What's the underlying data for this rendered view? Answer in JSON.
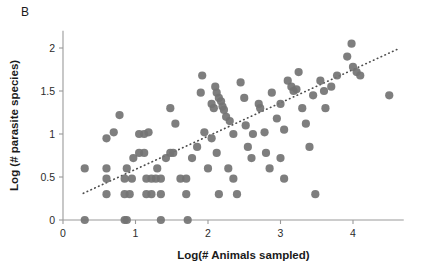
{
  "panel": {
    "label": "B"
  },
  "chart_data": {
    "type": "scatter",
    "title": "",
    "xlabel": "Log(# Animals sampled)",
    "ylabel": "Log (# parasite species)",
    "xlim": [
      0,
      4.7
    ],
    "ylim": [
      0,
      2.2
    ],
    "xticks": [
      0,
      1,
      2,
      3,
      4
    ],
    "yticks": [
      0,
      0.5,
      1,
      1.5,
      2
    ],
    "xtick_labels": [
      "0",
      "1",
      "2",
      "3",
      "4"
    ],
    "ytick_labels": [
      "0",
      "0.5",
      "1",
      "1.5",
      "2"
    ],
    "grid": false,
    "legend": null,
    "marker_color": "#737373",
    "marker_size": 7,
    "trendline": {
      "type": "linear-fit",
      "style": "dotted",
      "color": "#4d4d4d",
      "x_start": 0.28,
      "y_start": 0.31,
      "x_end": 4.65,
      "y_end": 2.0
    },
    "points": [
      [
        0.3,
        0.6
      ],
      [
        0.3,
        0.0
      ],
      [
        0.6,
        0.48
      ],
      [
        0.6,
        0.6
      ],
      [
        0.6,
        0.3
      ],
      [
        0.6,
        0.95
      ],
      [
        0.7,
        1.02
      ],
      [
        0.78,
        1.22
      ],
      [
        0.85,
        0.0
      ],
      [
        0.88,
        0.0
      ],
      [
        0.85,
        0.3
      ],
      [
        0.92,
        0.3
      ],
      [
        0.85,
        0.48
      ],
      [
        0.95,
        0.48
      ],
      [
        0.88,
        0.6
      ],
      [
        0.97,
        0.72
      ],
      [
        1.05,
        0.78
      ],
      [
        1.12,
        0.78
      ],
      [
        1.05,
        1.0
      ],
      [
        1.12,
        1.0
      ],
      [
        1.18,
        1.02
      ],
      [
        1.15,
        0.48
      ],
      [
        1.22,
        0.48
      ],
      [
        1.28,
        0.48
      ],
      [
        1.15,
        0.3
      ],
      [
        1.22,
        0.3
      ],
      [
        1.3,
        0.6
      ],
      [
        1.35,
        0.0
      ],
      [
        1.35,
        0.3
      ],
      [
        1.35,
        0.48
      ],
      [
        1.42,
        0.72
      ],
      [
        1.48,
        0.78
      ],
      [
        1.52,
        0.78
      ],
      [
        1.48,
        1.3
      ],
      [
        1.55,
        1.12
      ],
      [
        1.62,
        0.48
      ],
      [
        1.7,
        0.48
      ],
      [
        1.72,
        0.0
      ],
      [
        1.7,
        0.3
      ],
      [
        1.78,
        0.72
      ],
      [
        1.85,
        0.85
      ],
      [
        1.9,
        1.48
      ],
      [
        1.92,
        1.68
      ],
      [
        1.95,
        1.02
      ],
      [
        2.0,
        0.6
      ],
      [
        2.05,
        1.35
      ],
      [
        2.08,
        1.3
      ],
      [
        2.1,
        1.55
      ],
      [
        2.12,
        1.48
      ],
      [
        2.15,
        1.42
      ],
      [
        2.18,
        1.38
      ],
      [
        2.2,
        1.32
      ],
      [
        2.22,
        1.28
      ],
      [
        2.05,
        0.95
      ],
      [
        2.12,
        0.78
      ],
      [
        2.15,
        0.3
      ],
      [
        2.25,
        1.2
      ],
      [
        2.3,
        1.15
      ],
      [
        2.35,
        1.0
      ],
      [
        2.28,
        0.6
      ],
      [
        2.35,
        0.48
      ],
      [
        2.4,
        0.3
      ],
      [
        2.45,
        1.6
      ],
      [
        2.5,
        1.42
      ],
      [
        2.52,
        1.1
      ],
      [
        2.55,
        0.85
      ],
      [
        2.6,
        0.72
      ],
      [
        2.62,
        1.0
      ],
      [
        2.7,
        1.35
      ],
      [
        2.72,
        1.3
      ],
      [
        2.78,
        1.02
      ],
      [
        2.8,
        0.78
      ],
      [
        2.85,
        0.6
      ],
      [
        2.88,
        1.48
      ],
      [
        2.95,
        1.18
      ],
      [
        3.0,
        1.35
      ],
      [
        3.05,
        1.05
      ],
      [
        3.0,
        0.72
      ],
      [
        3.05,
        0.48
      ],
      [
        3.1,
        1.62
      ],
      [
        3.15,
        1.55
      ],
      [
        3.18,
        1.5
      ],
      [
        3.22,
        1.52
      ],
      [
        3.25,
        1.72
      ],
      [
        3.3,
        1.3
      ],
      [
        3.35,
        1.12
      ],
      [
        3.4,
        0.85
      ],
      [
        3.45,
        1.45
      ],
      [
        3.48,
        0.3
      ],
      [
        3.55,
        1.62
      ],
      [
        3.6,
        1.5
      ],
      [
        3.62,
        1.3
      ],
      [
        3.7,
        1.55
      ],
      [
        3.78,
        1.68
      ],
      [
        3.92,
        1.9
      ],
      [
        3.98,
        2.05
      ],
      [
        4.0,
        1.78
      ],
      [
        4.05,
        1.72
      ],
      [
        4.1,
        1.68
      ],
      [
        4.5,
        1.45
      ]
    ]
  }
}
